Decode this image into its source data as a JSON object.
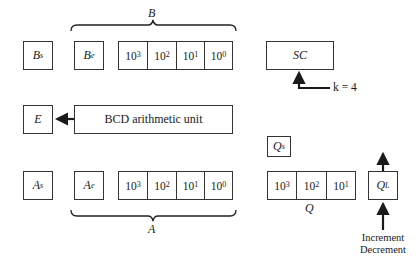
{
  "registers": {
    "bs": {
      "label": "B",
      "sub": "s"
    },
    "be": {
      "label": "B",
      "sub": "e"
    },
    "b_digits": [
      {
        "base": "10",
        "exp": "3"
      },
      {
        "base": "10",
        "exp": "2"
      },
      {
        "base": "10",
        "exp": "1"
      },
      {
        "base": "10",
        "exp": "0"
      }
    ],
    "b_brace_label": "B",
    "sc": {
      "label": "SC"
    },
    "sc_input": "k = 4",
    "e": {
      "label": "E"
    },
    "alu": {
      "label": "BCD arithmetic unit"
    },
    "as": {
      "label": "A",
      "sub": "s"
    },
    "ae": {
      "label": "A",
      "sub": "e"
    },
    "a_digits": [
      {
        "base": "10",
        "exp": "3"
      },
      {
        "base": "10",
        "exp": "2"
      },
      {
        "base": "10",
        "exp": "1"
      },
      {
        "base": "10",
        "exp": "0"
      }
    ],
    "a_brace_label": "A",
    "qs": {
      "label": "Q",
      "sub": "s"
    },
    "q_digits": [
      {
        "base": "10",
        "exp": "3"
      },
      {
        "base": "10",
        "exp": "2"
      },
      {
        "base": "10",
        "exp": "1"
      }
    ],
    "q_label": "Q",
    "ql": {
      "label": "Q",
      "sub": "L"
    },
    "ql_input_line1": "Increment",
    "ql_input_line2": "Decrement"
  }
}
